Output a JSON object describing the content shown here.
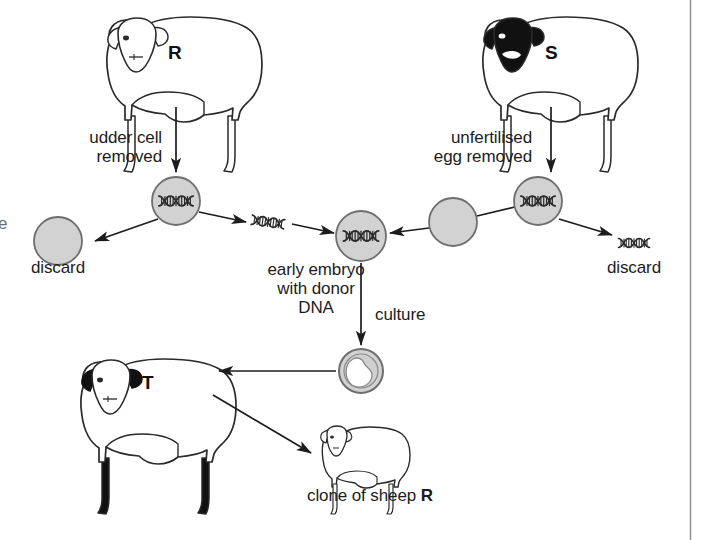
{
  "figure": {
    "width": 708,
    "height": 540,
    "background": "#ffffff",
    "border_rule_color": "#8d8d8d"
  },
  "colors": {
    "ink": "#1c1c1c",
    "outline": "#3b3b3b",
    "cell_fill": "#d2d2d2",
    "cell_stroke": "#6e6e6e",
    "dna_dark": "#2d2d2d",
    "sheep_black": "#111111",
    "sheep_body": "#ffffff"
  },
  "sheep": [
    {
      "id": "R",
      "letter": "R",
      "name": "donor-sheep-R",
      "face": "white",
      "legs": "white",
      "size": "large"
    },
    {
      "id": "S",
      "letter": "S",
      "name": "egg-donor-sheep-S",
      "face": "black",
      "legs": "white",
      "size": "large"
    },
    {
      "id": "T",
      "letter": "T",
      "name": "surrogate-sheep-T",
      "face": "black-ears",
      "legs": "black",
      "size": "large"
    },
    {
      "id": "clone",
      "letter": "",
      "name": "clone-lamb",
      "face": "white",
      "legs": "white",
      "size": "small"
    }
  ],
  "labels": {
    "udder_cell_removed": "udder cell\nremoved",
    "unfertilised_egg_removed": "unfertilised\negg removed",
    "discard_left": "discard",
    "discard_right": "discard",
    "early_embryo": "early embryo\nwith donor\nDNA",
    "culture": "culture",
    "clone_of_sheep": "clone of sheep ",
    "clone_of_sheep_bold": "R",
    "clipped_left_fragment": "e"
  },
  "cells": [
    {
      "name": "udder-cell-nucleus",
      "kind": "cell-with-dna",
      "label": "udder cell with nucleus (DNA)",
      "cx": 176,
      "cy": 201,
      "r": 24
    },
    {
      "name": "discarded-cytoplasm",
      "kind": "plain-cell",
      "label": "discarded cell cytoplasm",
      "cx": 58,
      "cy": 241,
      "r": 24
    },
    {
      "name": "early-embryo-cell",
      "kind": "cell-with-dna",
      "label": "early embryo with donor DNA",
      "cx": 361,
      "cy": 236,
      "r": 25
    },
    {
      "name": "enucleated-egg",
      "kind": "plain-cell",
      "label": "enucleated unfertilised egg",
      "cx": 453,
      "cy": 222,
      "r": 24
    },
    {
      "name": "unfertilised-egg-nucleus",
      "kind": "cell-with-dna",
      "label": "unfertilised egg with nucleus",
      "cx": 538,
      "cy": 201,
      "r": 24
    },
    {
      "name": "blastocyst",
      "kind": "blastocyst",
      "label": "cultured embryo (blastocyst)",
      "cx": 361,
      "cy": 371,
      "r": 22
    }
  ],
  "free_dna": [
    {
      "name": "donor-dna-transfer",
      "label": "donor DNA being transferred",
      "cx": 268,
      "cy": 222
    },
    {
      "name": "discarded-egg-dna",
      "label": "discarded egg DNA",
      "cx": 634,
      "cy": 243
    }
  ],
  "arrows": [
    {
      "name": "arrow-sheep-r-to-udder-cell",
      "from": "sheep R",
      "to": "udder cell",
      "direction": "down"
    },
    {
      "name": "arrow-udder-cell-to-discard",
      "from": "udder cell",
      "to": "discard",
      "direction": "down-left"
    },
    {
      "name": "arrow-dna-to-embryo",
      "from": "udder cell DNA",
      "to": "early embryo",
      "direction": "down-right"
    },
    {
      "name": "arrow-sheep-s-to-egg",
      "from": "sheep S",
      "to": "unfertilised egg",
      "direction": "down"
    },
    {
      "name": "arrow-egg-to-discard-dna",
      "from": "unfertilised egg",
      "to": "discard DNA",
      "direction": "down-right"
    },
    {
      "name": "arrow-enucleated-egg-to-embryo",
      "from": "enucleated egg",
      "to": "early embryo",
      "direction": "left"
    },
    {
      "name": "arrow-embryo-to-blastocyst",
      "from": "early embryo",
      "to": "blastocyst",
      "direction": "down",
      "label": "culture"
    },
    {
      "name": "arrow-blastocyst-to-sheep-t",
      "from": "blastocyst",
      "to": "sheep T",
      "direction": "left"
    },
    {
      "name": "arrow-sheep-t-to-clone",
      "from": "sheep T",
      "to": "clone lamb",
      "direction": "down-right"
    }
  ]
}
